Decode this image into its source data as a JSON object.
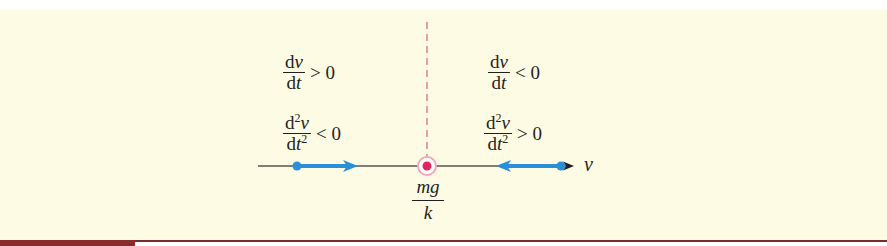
{
  "figure": {
    "type": "phase-line",
    "axis_label": "v",
    "equilibrium": {
      "numerator": "mg",
      "denominator": "k",
      "color": "#e0245e",
      "ring_color": "#f4a7b9"
    },
    "dashed_line_color": "#e06a80",
    "flow_color": "#2b8fd6",
    "axis_color": "#555555",
    "left_region": {
      "first_derivative": {
        "num": "dv",
        "den": "dt",
        "relation": "> 0"
      },
      "second_derivative": {
        "num": "d²v",
        "den": "dt²",
        "relation": "< 0"
      },
      "flow_direction": "right"
    },
    "right_region": {
      "first_derivative": {
        "num": "dv",
        "den": "dt",
        "relation": "< 0"
      },
      "second_derivative": {
        "num": "d²v",
        "den": "dt²",
        "relation": "> 0"
      },
      "flow_direction": "left"
    }
  },
  "colors": {
    "panel_background": "#fdfbe4",
    "bottom_rule": "#7a2a2e"
  }
}
